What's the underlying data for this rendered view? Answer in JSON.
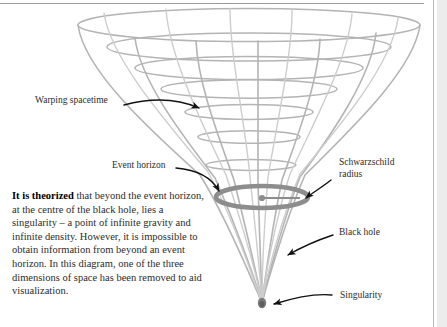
{
  "figure": {
    "colors": {
      "wireframe": "#b0b0b0",
      "wireframe_light": "#c6c6c6",
      "ring": "#8a8a8a",
      "singularity": "#6e6e6e",
      "arrow": "#111111",
      "text": "#2b2b2b",
      "rule": "#9a9a9a",
      "strip": "#ececec"
    }
  },
  "labels": {
    "warping_spacetime": "Warping spacetime",
    "event_horizon": "Event horizon",
    "schwarzschild_radius": "Schwarzschild\nradius",
    "black_hole": "Black hole",
    "singularity": "Singularity"
  },
  "body": {
    "lede": "It is theorized",
    "text": " that beyond the event horizon, at the centre of the black hole, lies a singularity – a point of infinite gravity and infinite density. However, it is impossible to obtain information from beyond an event horizon. In this diagram, one of the three dimensions of space has been removed to aid visualization."
  }
}
